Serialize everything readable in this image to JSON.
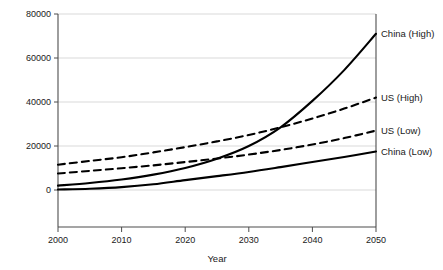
{
  "chart_data": {
    "type": "line",
    "title": "",
    "xlabel": "Year",
    "ylabel": "Power",
    "xlim": [
      2000,
      2050
    ],
    "ylim": [
      0,
      80000
    ],
    "grid": true,
    "legend_position": "right-of-plot-inline",
    "x": [
      2000,
      2005,
      2010,
      2015,
      2020,
      2025,
      2030,
      2035,
      2040,
      2045,
      2050
    ],
    "xticks": [
      "2000",
      "2010",
      "2020",
      "2030",
      "2040",
      "2050"
    ],
    "yticks": [
      "0",
      "20000",
      "40000",
      "60000",
      "80000"
    ],
    "series": [
      {
        "name": "China (High)",
        "style": "solid",
        "color": "#000000",
        "values": [
          2000,
          3200,
          4800,
          7000,
          10000,
          14200,
          20000,
          28500,
          40500,
          54500,
          71000
        ]
      },
      {
        "name": "US (High)",
        "style": "dashed",
        "color": "#000000",
        "values": [
          11500,
          13200,
          14900,
          17100,
          19500,
          22100,
          25000,
          28500,
          32500,
          37000,
          42000
        ]
      },
      {
        "name": "US (Low)",
        "style": "dashed",
        "color": "#000000",
        "values": [
          7500,
          8700,
          9900,
          11200,
          12700,
          14300,
          16100,
          18200,
          20700,
          23600,
          27000
        ]
      },
      {
        "name": "China (Low)",
        "style": "solid",
        "color": "#000000",
        "values": [
          200,
          600,
          1300,
          2600,
          4500,
          6300,
          8200,
          10400,
          12700,
          15000,
          17500
        ]
      }
    ]
  },
  "axes": {
    "y_title": "Power",
    "x_title": "Year",
    "y_tick_labels": [
      "80000",
      "60000",
      "40000",
      "20000",
      "0"
    ],
    "x_tick_labels": [
      "2000",
      "2010",
      "2020",
      "2030",
      "2040",
      "2050"
    ]
  },
  "series_labels": [
    {
      "text": "China (High)"
    },
    {
      "text": "US (High)"
    },
    {
      "text": "US (Low)"
    },
    {
      "text": "China (Low)"
    }
  ],
  "colors": {
    "line": "#000000",
    "grid": "#c8c8c8",
    "axis": "#4d4d4d",
    "background": "#ffffff",
    "text": "#1a1a1a"
  }
}
